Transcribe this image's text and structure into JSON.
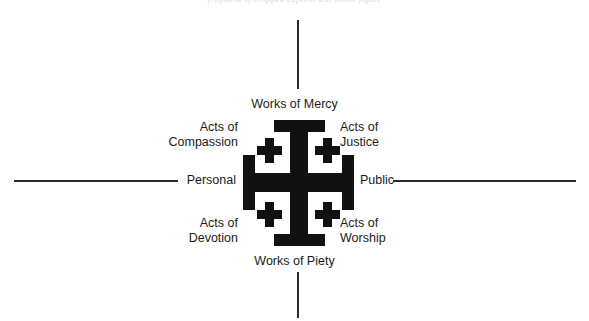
{
  "page": {
    "width": 589,
    "height": 321,
    "background_color": "#ffffff",
    "ink_color": "#111111",
    "axis_color": "#2b2b2b",
    "clipped_header_text": "fragment of cropped caption text above figure"
  },
  "diagram": {
    "center_symbol": "jerusalem-cross",
    "axes": {
      "vertical": {
        "top_label": "Works of Mercy",
        "bottom_label": "Works of Piety"
      },
      "horizontal": {
        "left_label": "Personal",
        "right_label": "Public"
      }
    },
    "quadrants": [
      {
        "position": "top-left",
        "line1": "Acts of",
        "line2": "Compassion"
      },
      {
        "position": "top-right",
        "line1": "Acts of",
        "line2": "Justice"
      },
      {
        "position": "bottom-left",
        "line1": "Acts of",
        "line2": "Devotion"
      },
      {
        "position": "bottom-right",
        "line1": "Acts of",
        "line2": "Worship"
      }
    ]
  }
}
